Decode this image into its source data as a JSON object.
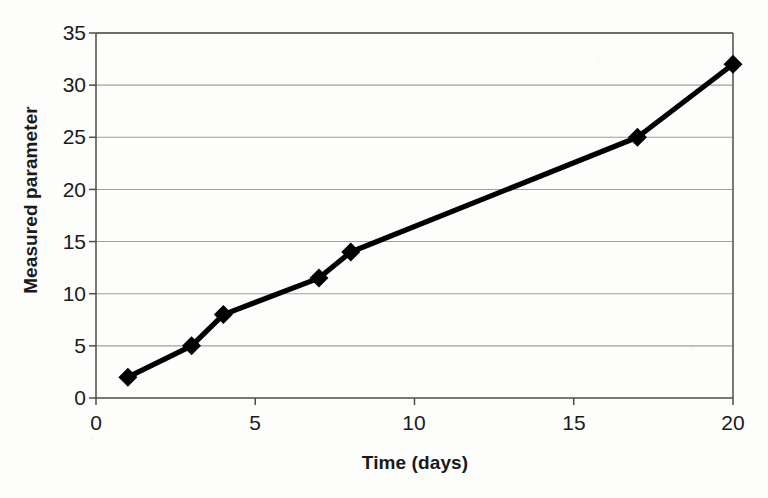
{
  "chart_data": {
    "type": "line",
    "title": "",
    "xlabel": "Time (days)",
    "ylabel": "Measured parameter",
    "xlim": [
      0,
      20
    ],
    "ylim": [
      0,
      35
    ],
    "xticks": [
      0,
      5,
      10,
      15,
      20
    ],
    "yticks": [
      0,
      5,
      10,
      15,
      20,
      25,
      30,
      35
    ],
    "xtick_labels": [
      "0",
      "5",
      "10",
      "15",
      "20"
    ],
    "ytick_labels": [
      "0",
      "5",
      "10",
      "15",
      "20",
      "25",
      "30",
      "35"
    ],
    "grid": "horizontal",
    "legend": "none",
    "series": [
      {
        "name": "Measured parameter",
        "marker": "filled-diamond",
        "color": "#000000",
        "x": [
          1,
          3,
          4,
          7,
          8,
          17,
          20
        ],
        "values": [
          2,
          5,
          8,
          11.5,
          14,
          25,
          32
        ],
        "points": [
          {
            "x": 1,
            "y": 2
          },
          {
            "x": 3,
            "y": 5
          },
          {
            "x": 4,
            "y": 8
          },
          {
            "x": 7,
            "y": 11.5
          },
          {
            "x": 8,
            "y": 14
          },
          {
            "x": 17,
            "y": 25
          },
          {
            "x": 20,
            "y": 32
          }
        ]
      }
    ]
  },
  "style": {
    "line_color": "#141414",
    "marker_color": "#141414",
    "grid_color": "#808080",
    "axis_color": "#4d4d4d",
    "text_color": "#1a1a1a",
    "background": "#fdfdfc"
  }
}
